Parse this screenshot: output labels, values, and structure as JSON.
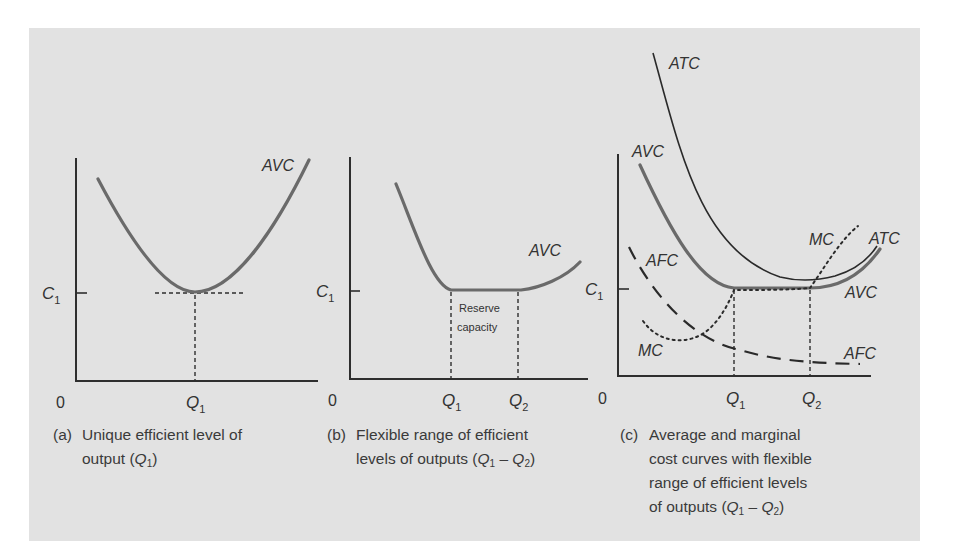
{
  "figure": {
    "panels": [
      {
        "id": "a",
        "caption_tag": "(a)",
        "caption_line1": "Unique efficient level of",
        "caption_line2_prefix": "output (",
        "caption_line2_suffix": ")",
        "caption_q": "Q",
        "caption_sub": "1",
        "origin_label": "0",
        "y_tick_label": "C",
        "y_tick_sub": "1",
        "x_ticks": [
          {
            "label": "Q",
            "sub": "1"
          }
        ],
        "curves": [
          {
            "name": "AVC",
            "label": "AVC",
            "style": "solid-thick"
          }
        ]
      },
      {
        "id": "b",
        "caption_tag": "(b)",
        "caption_line1": "Flexible range of efficient",
        "caption_line2_prefix": "levels of outputs (",
        "caption_line2_suffix": ")",
        "caption_range": [
          "Q",
          "1",
          "Q",
          "2"
        ],
        "origin_label": "0",
        "y_tick_label": "C",
        "y_tick_sub": "1",
        "x_ticks": [
          {
            "label": "Q",
            "sub": "1"
          },
          {
            "label": "Q",
            "sub": "2"
          }
        ],
        "annotation_line1": "Reserve",
        "annotation_line2": "capacity",
        "curves": [
          {
            "name": "AVC",
            "label": "AVC",
            "style": "solid-thick"
          }
        ]
      },
      {
        "id": "c",
        "caption_tag": "(c)",
        "caption_line1": "Average and marginal",
        "caption_line2": "cost curves with flexible",
        "caption_line3": "range of efficient levels",
        "caption_line4_prefix": "of outputs (",
        "caption_line4_suffix": ")",
        "origin_label": "0",
        "y_tick_label": "C",
        "y_tick_sub": "1",
        "x_ticks": [
          {
            "label": "Q",
            "sub": "1"
          },
          {
            "label": "Q",
            "sub": "2"
          }
        ],
        "curves": [
          {
            "name": "ATC",
            "label": "ATC",
            "label_right": "ATC",
            "style": "solid-thin"
          },
          {
            "name": "AVC",
            "label": "AVC",
            "label_right": "AVC",
            "style": "solid-thick"
          },
          {
            "name": "AFC",
            "label": "AFC",
            "label_right": "AFC",
            "style": "long-dash"
          },
          {
            "name": "MC",
            "label": "MC",
            "label_right": "MC",
            "style": "dotted"
          }
        ]
      }
    ],
    "range_dash": "–"
  },
  "colors": {
    "background_panel": "#e2e2e2",
    "curve_avc": "#6a6a6a",
    "curve_dark": "#2a2a2a",
    "text": "#3a3a3a"
  }
}
